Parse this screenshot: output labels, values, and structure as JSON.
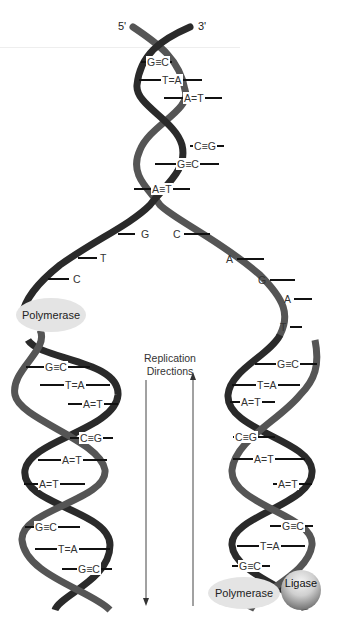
{
  "title_labels": {
    "five_prime": "5'",
    "three_prime": "3'"
  },
  "parent_helix": {
    "base_pairs": [
      "G≡C",
      "T=A",
      "A=T",
      "C≡G",
      "G≡C",
      "A≡T"
    ]
  },
  "fork": {
    "left_single_strand_bases": [
      "G",
      "T",
      "C"
    ],
    "right_single_strand_bases": [
      "C",
      "A",
      "G",
      "A",
      "T"
    ]
  },
  "left_daughter": {
    "base_pairs": [
      "G≡C",
      "T=A",
      "A=T",
      "C≡G",
      "A=T",
      "A=T",
      "G≡C",
      "T=A",
      "G≡C"
    ]
  },
  "right_daughter": {
    "base_pairs": [
      "G≡C",
      "T=A",
      "A=T",
      "C≡G",
      "A=T",
      "A=T",
      "G≡C",
      "T=A",
      "G≡C"
    ]
  },
  "enzymes": {
    "polymerase_left": "Polymerase",
    "polymerase_right": "Polymerase",
    "ligase": "Ligase"
  },
  "replication_directions": {
    "label_line1": "Replication",
    "label_line2": "Directions"
  },
  "colors": {
    "strand_dark": "#2a2a2a",
    "strand_mid": "#555555",
    "enzyme_fill": "#e4e4e4"
  }
}
